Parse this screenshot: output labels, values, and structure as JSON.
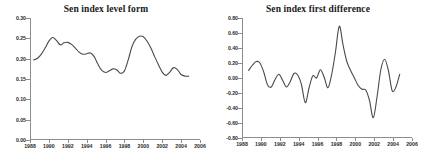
{
  "figure": {
    "background": "#ffffff",
    "line_color": "#4a4a4a",
    "axis_color": "#8d8d8d"
  },
  "chart_data": [
    {
      "type": "line",
      "title": "Sen index level form",
      "xlabel": "",
      "ylabel": "",
      "grid": false,
      "legend": "none",
      "xlim": [
        1988,
        2006
      ],
      "ylim": [
        0.0,
        0.3
      ],
      "xticks": [
        1988,
        1990,
        1992,
        1994,
        1996,
        1998,
        2000,
        2002,
        2004,
        2006
      ],
      "xtick_labels": [
        "1988",
        "1990",
        "1992",
        "1994",
        "1996",
        "1998",
        "2000",
        "2002",
        "2004",
        "2006"
      ],
      "yticks": [
        0.0,
        0.05,
        0.1,
        0.15,
        0.2,
        0.25,
        0.3
      ],
      "ytick_labels": [
        "0.00",
        "0.05",
        "0.10",
        "0.15",
        "0.20",
        "0.25",
        "0.30"
      ],
      "series": [
        {
          "name": "Sen index level",
          "x": [
            1988.4,
            1988.8,
            1989.2,
            1989.6,
            1990.0,
            1990.4,
            1990.8,
            1991.2,
            1991.6,
            1992.0,
            1992.4,
            1992.8,
            1993.2,
            1993.6,
            1994.0,
            1994.4,
            1994.8,
            1995.2,
            1995.6,
            1996.0,
            1996.4,
            1996.8,
            1997.2,
            1997.6,
            1998.0,
            1998.4,
            1998.8,
            1999.2,
            1999.6,
            2000.0,
            2000.4,
            2000.8,
            2001.2,
            2001.6,
            2002.0,
            2002.4,
            2002.8,
            2003.2,
            2003.6,
            2004.0,
            2004.4,
            2004.8
          ],
          "y": [
            0.197,
            0.201,
            0.211,
            0.226,
            0.243,
            0.252,
            0.245,
            0.234,
            0.239,
            0.24,
            0.235,
            0.226,
            0.216,
            0.211,
            0.212,
            0.214,
            0.205,
            0.186,
            0.171,
            0.166,
            0.17,
            0.175,
            0.172,
            0.164,
            0.17,
            0.197,
            0.23,
            0.248,
            0.255,
            0.254,
            0.243,
            0.226,
            0.205,
            0.185,
            0.167,
            0.159,
            0.167,
            0.178,
            0.173,
            0.161,
            0.157,
            0.157
          ]
        }
      ]
    },
    {
      "type": "line",
      "title": "Sen index first difference",
      "xlabel": "",
      "ylabel": "",
      "grid": false,
      "legend": "none",
      "xlim": [
        1988,
        2006
      ],
      "ylim": [
        -0.8,
        0.8
      ],
      "xticks": [
        1988,
        1990,
        1992,
        1994,
        1996,
        1998,
        2000,
        2002,
        2004,
        2006
      ],
      "xtick_labels": [
        "1988",
        "1990",
        "1992",
        "1994",
        "1996",
        "1998",
        "2000",
        "2002",
        "2004",
        "2006"
      ],
      "yticks": [
        -0.8,
        -0.6,
        -0.4,
        -0.2,
        0.0,
        0.2,
        0.4,
        0.6,
        0.8
      ],
      "ytick_labels": [
        "-0.80",
        "-0.60",
        "-0.40",
        "-0.20",
        "0.00",
        "0.20",
        "0.40",
        "0.60",
        "0.80"
      ],
      "series": [
        {
          "name": "Sen index first difference",
          "x": [
            1988.7,
            1989.1,
            1989.5,
            1989.9,
            1990.3,
            1990.7,
            1991.1,
            1991.5,
            1991.9,
            1992.3,
            1992.7,
            1993.1,
            1993.5,
            1993.9,
            1994.3,
            1994.7,
            1995.1,
            1995.5,
            1995.9,
            1996.3,
            1996.7,
            1997.1,
            1997.5,
            1997.9,
            1998.3,
            1998.7,
            1999.1,
            1999.5,
            1999.9,
            2000.3,
            2000.7,
            2001.1,
            2001.5,
            2001.9,
            2002.3,
            2002.7,
            2003.1,
            2003.5,
            2003.9,
            2004.3,
            2004.7
          ],
          "y": [
            0.1,
            0.17,
            0.22,
            0.2,
            0.08,
            -0.09,
            -0.12,
            -0.02,
            0.05,
            -0.03,
            -0.12,
            -0.05,
            0.06,
            0.04,
            -0.09,
            -0.33,
            -0.13,
            0.03,
            0.0,
            0.11,
            0.01,
            -0.13,
            0.05,
            0.35,
            0.69,
            0.44,
            0.22,
            0.1,
            0.0,
            -0.1,
            -0.15,
            -0.16,
            -0.3,
            -0.53,
            -0.25,
            0.11,
            0.25,
            0.1,
            -0.17,
            -0.12,
            0.05
          ]
        }
      ]
    }
  ]
}
